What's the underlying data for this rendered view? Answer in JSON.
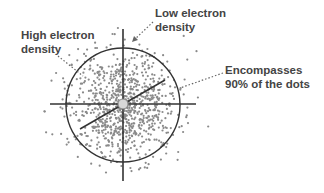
{
  "diagram": {
    "labels": {
      "high_density": {
        "line1": "High electron",
        "line2": "density"
      },
      "low_density": {
        "line1": "Low electron",
        "line2": "density"
      },
      "boundary": {
        "line1": "Encompasses",
        "line2": "90% of the dots"
      }
    },
    "colors": {
      "dots": "#8a8a8a",
      "lines": "#333333",
      "text": "#444444",
      "nucleus": "#d0d0d0",
      "pointer": "#666666"
    },
    "geometry": {
      "center": [
        123,
        105
      ],
      "circle_radius": 57,
      "boundary_percent": "90%"
    }
  }
}
